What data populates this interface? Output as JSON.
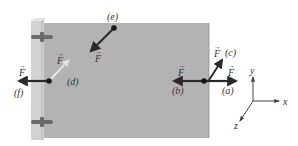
{
  "figure": {
    "colors": {
      "door": "#b3b3b3",
      "hinge_edge": "#cfcfcf",
      "hinge": "#6a6a6a",
      "arrow": "#2a2a2a",
      "faint_arrow": "#d8d8d8",
      "axis": "#444444"
    },
    "force_symbol": "F",
    "forces": [
      {
        "id": "a",
        "label": "(a)",
        "direction": "+x, perpendicular-out from door edge"
      },
      {
        "id": "b",
        "label": "(b)",
        "direction": "-x, toward hinge"
      },
      {
        "id": "c",
        "label": "(c)",
        "direction": "angled up-right"
      },
      {
        "id": "d",
        "label": "(d)",
        "direction": "angled, at hinge (faint)"
      },
      {
        "id": "e",
        "label": "(e)",
        "direction": "toward -z, out of door plane"
      },
      {
        "id": "f",
        "label": "(f)",
        "direction": "-x, applied at hinge"
      }
    ],
    "axes": {
      "x": "x",
      "y": "y",
      "z": "z"
    }
  }
}
